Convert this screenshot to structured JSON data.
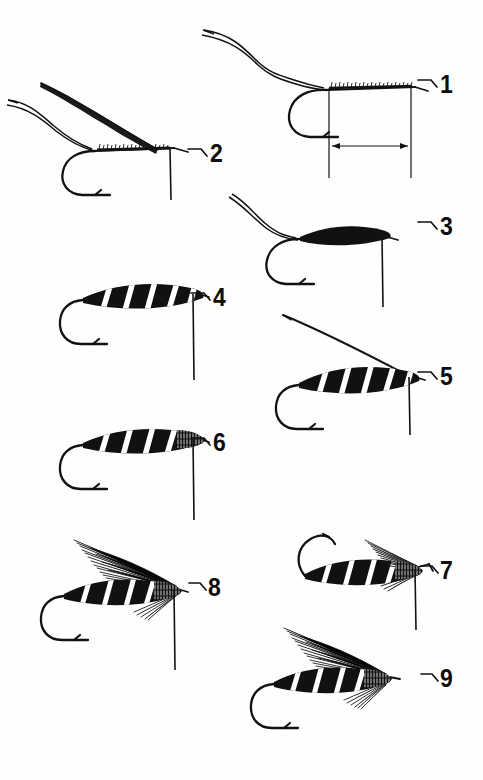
{
  "plate": {
    "title": "Fly Tying Step Sequence",
    "subject": "streamer wet fly",
    "background_color": "#ffffff",
    "ink_color": "#121212",
    "body_fill_color": "#111111",
    "rib_color": "#ffffff",
    "step_count": 9,
    "number_style": "bold condensed sans-serif with leader tick"
  },
  "steps": [
    {
      "number": "1",
      "label": "1",
      "caption": "Hook in vise with tippet; thread base wrapped along shank, body length marked",
      "column": "right",
      "has_tippet": true,
      "has_thread_wraps": true,
      "has_dimension": true,
      "has_wing": false,
      "body_style": "bare",
      "hook_flipped": false
    },
    {
      "number": "2",
      "label": "2",
      "caption": "Quill strip tied in at head, held up and back",
      "column": "left",
      "has_tippet": true,
      "has_thread_wraps": true,
      "has_dimension": false,
      "has_wing": false,
      "body_style": "bare",
      "hook_flipped": false
    },
    {
      "number": "3",
      "label": "3",
      "caption": "Tapered underbody wrapped solid black",
      "column": "right",
      "has_tippet": true,
      "has_thread_wraps": false,
      "has_dimension": false,
      "has_wing": false,
      "body_style": "solid",
      "hook_flipped": false
    },
    {
      "number": "4",
      "label": "4",
      "caption": "Body ribbed with diagonal tinsel stripes",
      "column": "left",
      "has_tippet": false,
      "has_thread_wraps": false,
      "has_dimension": false,
      "has_wing": false,
      "body_style": "ribbed",
      "hook_flipped": false
    },
    {
      "number": "5",
      "label": "5",
      "caption": "Hackle stem tied in at the head, sweeping up and back",
      "column": "right",
      "has_tippet": false,
      "has_thread_wraps": false,
      "has_dimension": false,
      "has_wing": false,
      "body_style": "ribbed",
      "hook_flipped": false
    },
    {
      "number": "6",
      "label": "6",
      "caption": "Ribbed body finished with hackle collar at the head",
      "column": "left",
      "has_tippet": false,
      "has_thread_wraps": false,
      "has_dimension": false,
      "has_wing": false,
      "body_style": "ribbed-collar",
      "hook_flipped": false
    },
    {
      "number": "7",
      "label": "7",
      "caption": "Hook inverted; first bunch of wing fibers tied at the head",
      "column": "right",
      "has_tippet": false,
      "has_thread_wraps": false,
      "has_dimension": false,
      "has_wing": true,
      "wing_size": "small",
      "body_style": "ribbed-collar",
      "hook_flipped": true
    },
    {
      "number": "8",
      "label": "8",
      "caption": "Full wing of long barb fibers swept back over the body",
      "column": "left",
      "has_tippet": false,
      "has_thread_wraps": false,
      "has_dimension": false,
      "has_wing": true,
      "wing_size": "large",
      "body_style": "ribbed-collar",
      "hook_flipped": false
    },
    {
      "number": "9",
      "label": "9",
      "caption": "Completed fly: wing, throat hackle and whip-finished head",
      "column": "right",
      "has_tippet": false,
      "has_thread_wraps": false,
      "has_dimension": false,
      "has_wing": true,
      "wing_size": "large",
      "body_style": "ribbed-collar",
      "hook_flipped": false
    }
  ]
}
